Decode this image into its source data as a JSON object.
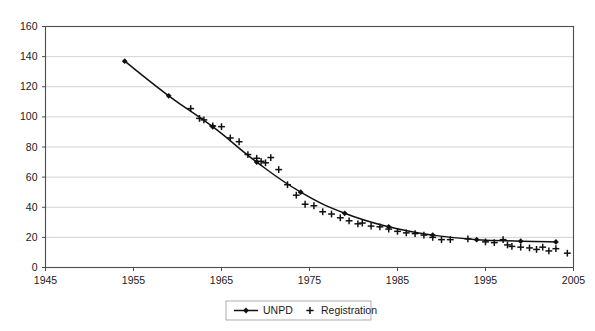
{
  "chart_data": {
    "type": "scatter",
    "title": "",
    "subtitle": "",
    "xlabel": "",
    "ylabel": "",
    "xlim": [
      1945,
      2005
    ],
    "ylim": [
      0,
      160
    ],
    "xticks": [
      1945,
      1955,
      1965,
      1975,
      1985,
      1995,
      2005
    ],
    "xtick_labels": [
      "1945",
      "1955",
      "1965",
      "1975",
      "1985",
      "1995",
      "2005"
    ],
    "yticks": [
      0,
      20,
      40,
      60,
      80,
      100,
      120,
      140,
      160
    ],
    "ytick_labels": [
      "0",
      "20",
      "40",
      "60",
      "80",
      "100",
      "120",
      "140",
      "160"
    ],
    "grid": "horizontal",
    "legend_position": "bottom-center",
    "series": [
      {
        "name": "UNPD",
        "marker": "diamond",
        "style": "line-with-markers",
        "color": "#111111",
        "points": [
          [
            1954.0,
            137.0
          ],
          [
            1959.0,
            114.0
          ],
          [
            1964.0,
            93.5
          ],
          [
            1969.0,
            70.0
          ],
          [
            1974.0,
            50.0
          ],
          [
            1979.0,
            36.0
          ],
          [
            1984.0,
            27.0
          ],
          [
            1989.0,
            21.5
          ],
          [
            1994.0,
            18.5
          ],
          [
            1999.0,
            17.5
          ],
          [
            2003.0,
            17.0
          ]
        ]
      },
      {
        "name": "Registration",
        "marker": "plus",
        "style": "markers-only",
        "color": "#111111",
        "points": [
          [
            1961.5,
            105.5
          ],
          [
            1962.5,
            99.0
          ],
          [
            1963.0,
            98.0
          ],
          [
            1964.0,
            94.0
          ],
          [
            1965.0,
            93.5
          ],
          [
            1966.0,
            86.0
          ],
          [
            1967.0,
            83.5
          ],
          [
            1968.0,
            75.0
          ],
          [
            1969.0,
            72.5
          ],
          [
            1969.5,
            70.5
          ],
          [
            1970.0,
            69.5
          ],
          [
            1970.6,
            73.0
          ],
          [
            1971.5,
            65.0
          ],
          [
            1972.5,
            55.0
          ],
          [
            1973.5,
            48.0
          ],
          [
            1974.5,
            42.0
          ],
          [
            1975.5,
            41.0
          ],
          [
            1976.5,
            37.0
          ],
          [
            1977.5,
            35.5
          ],
          [
            1978.5,
            33.0
          ],
          [
            1979.5,
            31.0
          ],
          [
            1980.5,
            29.0
          ],
          [
            1981.0,
            29.5
          ],
          [
            1982.0,
            27.5
          ],
          [
            1983.0,
            27.0
          ],
          [
            1984.0,
            25.5
          ],
          [
            1985.0,
            24.0
          ],
          [
            1986.0,
            23.0
          ],
          [
            1987.0,
            22.5
          ],
          [
            1988.0,
            21.5
          ],
          [
            1989.0,
            20.0
          ],
          [
            1990.0,
            18.5
          ],
          [
            1991.0,
            18.5
          ],
          [
            1993.0,
            19.0
          ],
          [
            1995.0,
            17.0
          ],
          [
            1996.0,
            16.5
          ],
          [
            1997.0,
            18.5
          ],
          [
            1997.5,
            15.0
          ],
          [
            1998.0,
            14.0
          ],
          [
            1999.0,
            13.5
          ],
          [
            2000.0,
            13.0
          ],
          [
            2000.8,
            12.0
          ],
          [
            2001.5,
            13.5
          ],
          [
            2002.2,
            11.0
          ],
          [
            2003.0,
            12.5
          ],
          [
            2004.3,
            9.5
          ]
        ]
      }
    ]
  },
  "legend": {
    "entries": [
      {
        "label": "UNPD",
        "marker": "line-diamond-marker"
      },
      {
        "label": "Registration",
        "marker": "plus-marker"
      }
    ]
  }
}
